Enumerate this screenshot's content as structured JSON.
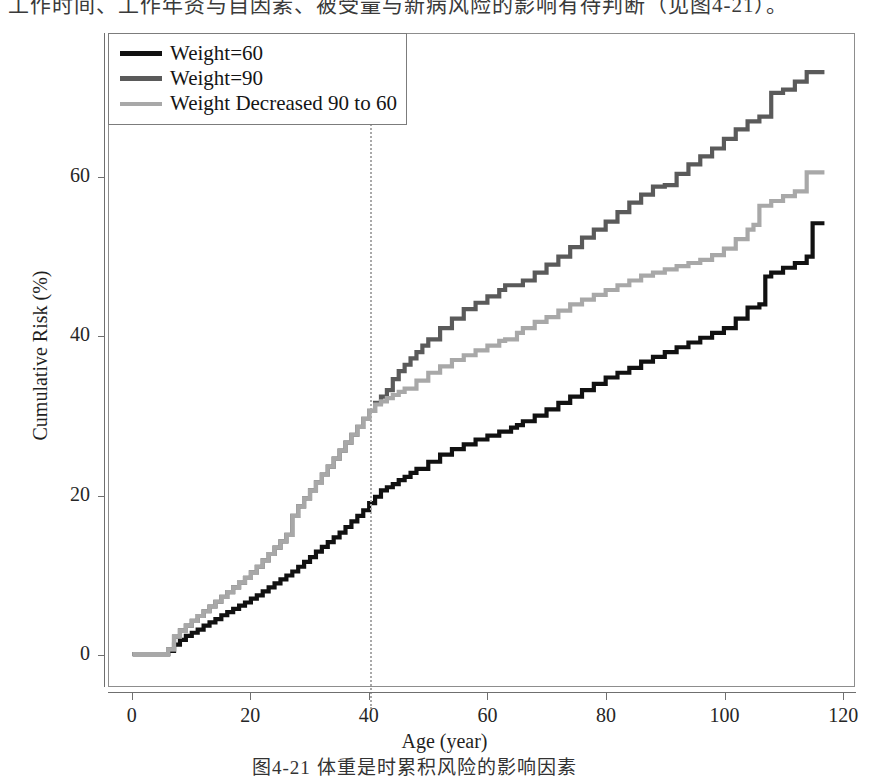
{
  "page": {
    "top_body_text": "工作时间、工作年资与自因素、被受量与新病风险的影响有待判断（见图4-21）。",
    "figure_caption": "图4-21  体重是时累积风险的影响因素"
  },
  "chart_data": {
    "type": "line",
    "title": "",
    "xlabel": "Age (year)",
    "ylabel": "Cumulative Risk (%)",
    "xlim": [
      -4,
      122
    ],
    "ylim": [
      -4,
      78
    ],
    "xticks": [
      0,
      20,
      40,
      60,
      80,
      100,
      120
    ],
    "yticks": [
      0,
      20,
      40,
      60
    ],
    "grid": false,
    "legend_position": "top-left",
    "annotations": [
      {
        "type": "vline",
        "x": 40,
        "style": "dotted",
        "color": "#a9a9a9",
        "label": ""
      }
    ],
    "colors": {
      "weight_60": "#111111",
      "weight_90": "#5a5a5a",
      "weight_decreased": "#a8a8a8",
      "frame": "#8d8d8d",
      "axis": "#6f6f6f",
      "background": "#ffffff"
    },
    "series": [
      {
        "name": "Weight=60",
        "color": "#111111",
        "linewidth": 4.2,
        "x": [
          0,
          5.5,
          6,
          7,
          8,
          9,
          10,
          11,
          12,
          13,
          14,
          15,
          16,
          17,
          18,
          19,
          20,
          21,
          22,
          23,
          24,
          25,
          26,
          27,
          28,
          29,
          30,
          31,
          32,
          33,
          34,
          35,
          36,
          37,
          38,
          39,
          40,
          41,
          42,
          43,
          44,
          45,
          46,
          47,
          48,
          50,
          52,
          54,
          56,
          58,
          60,
          62,
          64,
          65,
          66,
          68,
          70,
          72,
          74,
          76,
          78,
          80,
          82,
          84,
          86,
          88,
          90,
          92,
          94,
          96,
          98,
          100,
          102,
          104,
          106,
          107,
          108,
          110,
          112,
          114,
          115,
          117
        ],
        "y": [
          0,
          0,
          0.4,
          1.2,
          1.8,
          2.3,
          2.7,
          3.1,
          3.6,
          4.0,
          4.4,
          4.9,
          5.3,
          5.7,
          6.1,
          6.5,
          7.0,
          7.4,
          7.9,
          8.4,
          8.9,
          9.4,
          9.9,
          10.4,
          11.0,
          11.6,
          12.2,
          12.9,
          13.5,
          14.1,
          14.7,
          15.3,
          16.0,
          16.7,
          17.4,
          18.1,
          19.0,
          19.8,
          20.6,
          21.0,
          21.4,
          21.9,
          22.3,
          22.8,
          23.3,
          24.2,
          25.1,
          25.8,
          26.4,
          27.0,
          27.5,
          28.0,
          28.5,
          28.8,
          29.3,
          30.0,
          30.8,
          31.6,
          32.4,
          33.2,
          34.0,
          34.8,
          35.4,
          36.0,
          36.8,
          37.4,
          38.0,
          38.6,
          39.2,
          39.8,
          40.4,
          41.0,
          42.2,
          43.6,
          44.0,
          47.5,
          48.0,
          48.6,
          49.2,
          50.0,
          54.2,
          54.2
        ]
      },
      {
        "name": "Weight=90",
        "color": "#5a5a5a",
        "linewidth": 4.2,
        "x": [
          0,
          5.5,
          6,
          7,
          8,
          9,
          10,
          11,
          12,
          13,
          14,
          15,
          16,
          17,
          18,
          19,
          20,
          21,
          22,
          23,
          24,
          25,
          26,
          27,
          28,
          29,
          30,
          31,
          32,
          33,
          34,
          35,
          36,
          37,
          38,
          39,
          40,
          41,
          42,
          43,
          44,
          45,
          46,
          47,
          48,
          49,
          50,
          52,
          54,
          56,
          58,
          60,
          62,
          63,
          64,
          66,
          68,
          70,
          72,
          74,
          76,
          78,
          80,
          82,
          84,
          86,
          88,
          90,
          92,
          94,
          96,
          98,
          100,
          102,
          104,
          106,
          108,
          110,
          112,
          114,
          115,
          117
        ],
        "y": [
          0,
          0,
          0.6,
          2.2,
          3.0,
          3.6,
          4.2,
          4.8,
          5.4,
          6.0,
          6.6,
          7.2,
          7.8,
          8.4,
          9.0,
          9.6,
          10.3,
          11.0,
          11.8,
          12.6,
          13.4,
          14.2,
          15.0,
          17.4,
          18.6,
          19.6,
          20.6,
          21.6,
          22.6,
          23.6,
          24.6,
          25.6,
          26.6,
          27.6,
          28.6,
          29.6,
          30.6,
          31.6,
          32.4,
          33.2,
          34.6,
          35.6,
          36.4,
          37.2,
          38.0,
          38.8,
          39.6,
          41.0,
          42.2,
          43.4,
          44.2,
          45.0,
          45.8,
          46.4,
          46.4,
          47.0,
          48.0,
          49.0,
          50.0,
          51.2,
          52.4,
          53.4,
          54.4,
          55.6,
          56.8,
          57.8,
          58.8,
          59.0,
          60.4,
          61.6,
          62.6,
          63.6,
          64.8,
          66.0,
          67.0,
          67.6,
          70.6,
          71.0,
          72.0,
          73.2,
          73.2,
          73.2
        ]
      },
      {
        "name": "Weight Decreased 90 to 60",
        "color": "#a8a8a8",
        "linewidth": 4.2,
        "x": [
          0,
          5.5,
          6,
          7,
          8,
          9,
          10,
          11,
          12,
          13,
          14,
          15,
          16,
          17,
          18,
          19,
          20,
          21,
          22,
          23,
          24,
          25,
          26,
          27,
          28,
          29,
          30,
          31,
          32,
          33,
          34,
          35,
          36,
          37,
          38,
          39,
          40,
          41,
          42,
          43,
          44,
          45,
          46,
          48,
          50,
          52,
          54,
          56,
          58,
          60,
          62,
          63,
          64,
          65,
          66,
          68,
          70,
          72,
          74,
          76,
          78,
          80,
          82,
          84,
          86,
          88,
          90,
          92,
          94,
          96,
          98,
          100,
          102,
          104,
          105,
          106,
          108,
          110,
          112,
          114,
          115,
          117
        ],
        "y": [
          0,
          0,
          0.6,
          2.2,
          3.0,
          3.6,
          4.2,
          4.8,
          5.4,
          6.0,
          6.6,
          7.2,
          7.8,
          8.4,
          9.0,
          9.6,
          10.3,
          11.0,
          11.8,
          12.6,
          13.4,
          14.2,
          15.0,
          17.4,
          18.6,
          19.6,
          20.6,
          21.6,
          22.6,
          23.6,
          24.6,
          25.6,
          26.6,
          27.6,
          28.6,
          29.6,
          30.6,
          31.4,
          31.8,
          32.2,
          32.6,
          33.0,
          33.4,
          34.4,
          35.4,
          36.2,
          37.0,
          37.6,
          38.2,
          38.8,
          39.4,
          39.6,
          39.6,
          40.4,
          41.0,
          41.8,
          42.4,
          43.2,
          44.0,
          44.6,
          45.2,
          45.8,
          46.4,
          47.0,
          47.6,
          48.0,
          48.4,
          48.8,
          49.2,
          49.6,
          50.2,
          51.0,
          52.2,
          53.4,
          54.0,
          56.4,
          57.0,
          57.6,
          58.2,
          60.6,
          60.6,
          60.6
        ]
      }
    ]
  },
  "legend": {
    "items": [
      {
        "label": "Weight=60",
        "color": "#111111",
        "linewidth": 5
      },
      {
        "label": "Weight=90",
        "color": "#5a5a5a",
        "linewidth": 5
      },
      {
        "label": "Weight Decreased 90 to 60",
        "color": "#a8a8a8",
        "linewidth": 4
      }
    ]
  },
  "axes": {
    "y_title": "Cumulative Risk (%)",
    "x_title": "Age (year)",
    "y_tick_labels": [
      "0",
      "20",
      "40",
      "60"
    ],
    "x_tick_labels": [
      "0",
      "20",
      "40",
      "60",
      "80",
      "100",
      "120"
    ]
  }
}
